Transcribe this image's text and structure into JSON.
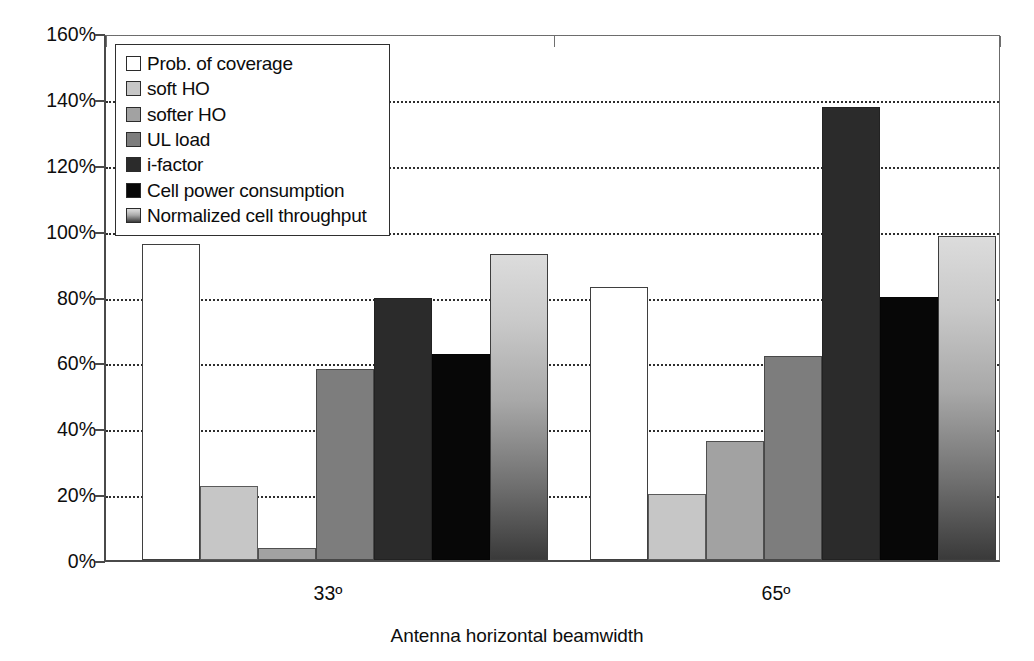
{
  "chart_data": {
    "type": "bar",
    "title": "",
    "xlabel": "Antenna horizontal beamwidth",
    "ylabel": "",
    "categories": [
      "33º",
      "65º"
    ],
    "ylim": [
      0,
      160
    ],
    "ytick_labels": [
      "0%",
      "20%",
      "40%",
      "60%",
      "80%",
      "100%",
      "120%",
      "140%",
      "160%"
    ],
    "ytick_values": [
      0,
      20,
      40,
      60,
      80,
      100,
      120,
      140,
      160
    ],
    "grid": true,
    "grid_axis": "y",
    "legend_position": "upper-left-inside",
    "value_unit": "%",
    "series": [
      {
        "name": "Prob. of coverage",
        "values": [
          96.0,
          83.0
        ],
        "color": "#ffffff",
        "fill": "solid"
      },
      {
        "name": "soft HO",
        "values": [
          22.5,
          20.0
        ],
        "color": "#c6c6c6",
        "fill": "solid"
      },
      {
        "name": "softer HO",
        "values": [
          3.5,
          36.0
        ],
        "color": "#a2a2a2",
        "fill": "solid"
      },
      {
        "name": "UL load",
        "values": [
          58.0,
          62.0
        ],
        "color": "#7d7d7d",
        "fill": "solid"
      },
      {
        "name": "i-factor",
        "values": [
          79.5,
          137.5
        ],
        "color": "#2b2b2b",
        "fill": "solid"
      },
      {
        "name": "Cell power consumption",
        "values": [
          62.5,
          80.0
        ],
        "color": "#070707",
        "fill": "solid"
      },
      {
        "name": "Normalized cell throughput",
        "values": [
          93.0,
          98.5
        ],
        "color": "#a8a8a8",
        "fill": "gradient-light-to-dark"
      }
    ]
  }
}
